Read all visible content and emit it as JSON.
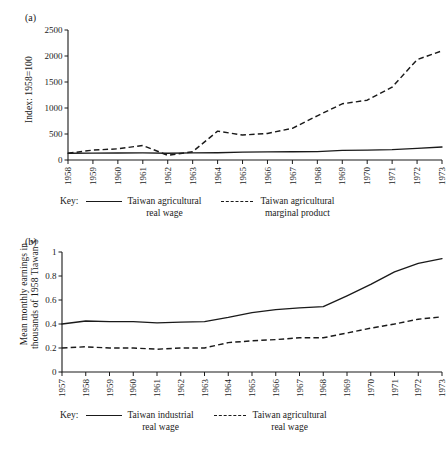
{
  "figure": {
    "panel_a_label": "(a)",
    "panel_b_label": "(b)",
    "legend_key_word": "Key:"
  },
  "chart_data": [
    {
      "id": "panel-a",
      "type": "line",
      "title": "",
      "panel": "(a)",
      "xlabel": "",
      "ylabel": "Index: 1958=100",
      "xlim": [
        1958,
        1973
      ],
      "ylim": [
        0,
        2500
      ],
      "yticks": [
        0,
        500,
        1000,
        1500,
        2000,
        2500
      ],
      "ytick_labels": [
        "0",
        "500",
        "1000",
        "1500",
        "2000",
        "2500"
      ],
      "grid": false,
      "legend_position": "below",
      "x": [
        1958,
        1959,
        1960,
        1961,
        1962,
        1963,
        1964,
        1965,
        1966,
        1967,
        1968,
        1969,
        1970,
        1971,
        1972,
        1973
      ],
      "xtick_labels": [
        "1958",
        "1959",
        "1960",
        "1961",
        "1962",
        "1963",
        "1964",
        "1965",
        "1966",
        "1967",
        "1968",
        "1969",
        "1970",
        "1971",
        "1972",
        "1973"
      ],
      "series": [
        {
          "name": "Taiwan agricultural real wage",
          "style": "solid",
          "values": [
            130,
            132,
            134,
            137,
            130,
            136,
            140,
            150,
            155,
            158,
            160,
            185,
            190,
            200,
            225,
            250
          ]
        },
        {
          "name": "Taiwan agricultural marginal product",
          "style": "dashed",
          "values": [
            130,
            190,
            215,
            280,
            90,
            160,
            555,
            480,
            510,
            610,
            850,
            1080,
            1150,
            1400,
            1930,
            2100
          ]
        }
      ]
    },
    {
      "id": "panel-b",
      "type": "line",
      "title": "",
      "panel": "(b)",
      "xlabel": "",
      "ylabel_line1": "Mean monthly earnings in",
      "ylabel_line2": "thousands of 1958 Tiawan $",
      "xlim": [
        1957,
        1973
      ],
      "ylim": [
        0,
        1
      ],
      "yticks": [
        0,
        0.2,
        0.4,
        0.6,
        0.8,
        1
      ],
      "ytick_labels": [
        "0",
        "0.2",
        "0.4",
        "0.6",
        "0.8",
        "1"
      ],
      "grid": false,
      "legend_position": "below",
      "x": [
        1957,
        1958,
        1959,
        1960,
        1961,
        1962,
        1963,
        1964,
        1965,
        1966,
        1967,
        1968,
        1969,
        1970,
        1971,
        1972,
        1973
      ],
      "xtick_labels": [
        "1957",
        "1958",
        "1959",
        "1960",
        "1961",
        "1962",
        "1963",
        "1964",
        "1965",
        "1966",
        "1967",
        "1968",
        "1969",
        "1970",
        "1971",
        "1972",
        "1973"
      ],
      "series": [
        {
          "name": "Taiwan industrial real wage",
          "style": "solid",
          "values": [
            0.4,
            0.425,
            0.42,
            0.42,
            0.41,
            0.415,
            0.42,
            0.455,
            0.495,
            0.52,
            0.535,
            0.545,
            0.635,
            0.73,
            0.835,
            0.905,
            0.945
          ]
        },
        {
          "name": "Taiwan agricultural real wage",
          "style": "dashed",
          "values": [
            0.2,
            0.21,
            0.2,
            0.2,
            0.19,
            0.2,
            0.2,
            0.245,
            0.26,
            0.27,
            0.285,
            0.285,
            0.325,
            0.365,
            0.4,
            0.44,
            0.46
          ]
        }
      ]
    }
  ],
  "panel_a": {
    "ylabel": "Index: 1958=100",
    "legend": {
      "key": "Key:",
      "entries": [
        {
          "style": "solid",
          "line1": "Taiwan agricultural",
          "line2": "real wage"
        },
        {
          "style": "dashed",
          "line1": "Taiwan agricultural",
          "line2": "marginal product"
        }
      ]
    }
  },
  "panel_b": {
    "ylabel_line1": "Mean monthly earnings in",
    "ylabel_line2": "thousands of 1958 Tiawan $",
    "legend": {
      "key": "Key:",
      "entries": [
        {
          "style": "solid",
          "line1": "Taiwan industrial",
          "line2": "real wage"
        },
        {
          "style": "dashed",
          "line1": "Taiwan agricultural",
          "line2": "real wage"
        }
      ]
    }
  }
}
